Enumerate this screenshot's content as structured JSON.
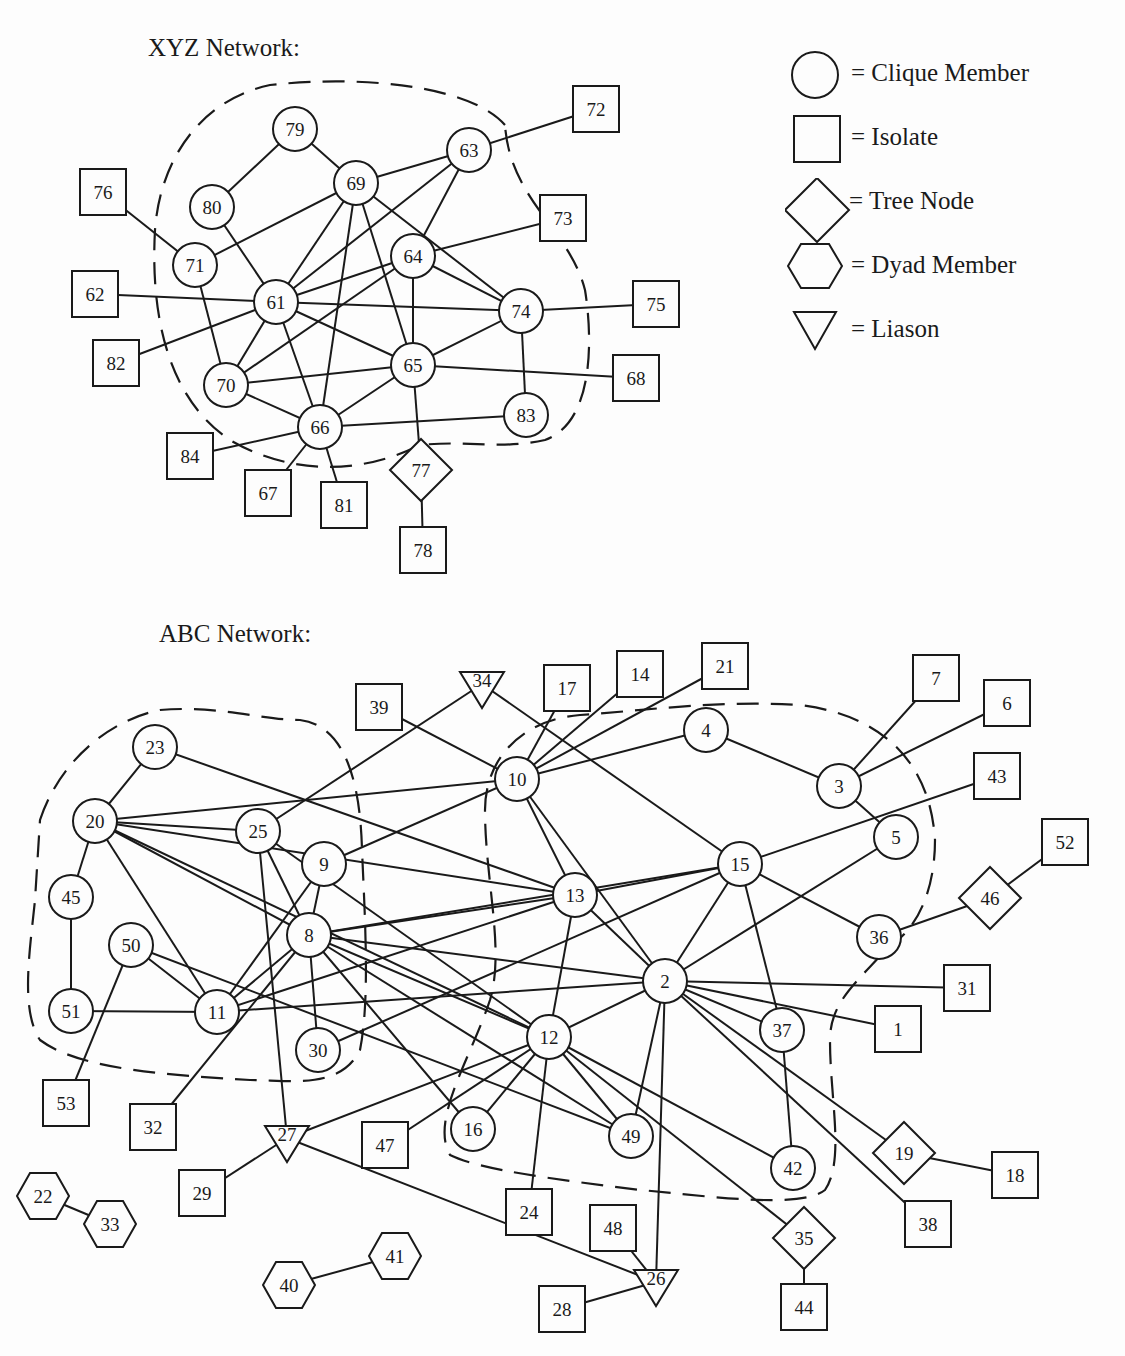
{
  "titles": {
    "xyz": "XYZ Network:",
    "abc": "ABC Network:"
  },
  "legend": [
    {
      "shape": "circle",
      "label": "= Clique Member"
    },
    {
      "shape": "square",
      "label": "= Isolate"
    },
    {
      "shape": "diamond",
      "label": "= Tree Node"
    },
    {
      "shape": "hexagon",
      "label": "= Dyad Member"
    },
    {
      "shape": "triangle",
      "label": "= Liason"
    }
  ],
  "colors": {
    "stroke": "#1a1a1a",
    "background": "#fdfdfd"
  },
  "xyz_network": {
    "nodes": [
      {
        "id": "61",
        "type": "circle",
        "x": 276,
        "y": 302
      },
      {
        "id": "62",
        "type": "square",
        "x": 95,
        "y": 294
      },
      {
        "id": "63",
        "type": "circle",
        "x": 469,
        "y": 150
      },
      {
        "id": "64",
        "type": "circle",
        "x": 413,
        "y": 256
      },
      {
        "id": "65",
        "type": "circle",
        "x": 413,
        "y": 365
      },
      {
        "id": "66",
        "type": "circle",
        "x": 320,
        "y": 427
      },
      {
        "id": "67",
        "type": "square",
        "x": 268,
        "y": 493
      },
      {
        "id": "68",
        "type": "square",
        "x": 636,
        "y": 378
      },
      {
        "id": "69",
        "type": "circle",
        "x": 356,
        "y": 183
      },
      {
        "id": "70",
        "type": "circle",
        "x": 226,
        "y": 385
      },
      {
        "id": "71",
        "type": "circle",
        "x": 195,
        "y": 265
      },
      {
        "id": "72",
        "type": "square",
        "x": 596,
        "y": 109
      },
      {
        "id": "73",
        "type": "square",
        "x": 563,
        "y": 218
      },
      {
        "id": "74",
        "type": "circle",
        "x": 521,
        "y": 311
      },
      {
        "id": "75",
        "type": "square",
        "x": 656,
        "y": 304
      },
      {
        "id": "76",
        "type": "square",
        "x": 103,
        "y": 192
      },
      {
        "id": "77",
        "type": "diamond",
        "x": 421,
        "y": 470
      },
      {
        "id": "78",
        "type": "square",
        "x": 423,
        "y": 550
      },
      {
        "id": "79",
        "type": "circle",
        "x": 295,
        "y": 129
      },
      {
        "id": "80",
        "type": "circle",
        "x": 212,
        "y": 207
      },
      {
        "id": "81",
        "type": "square",
        "x": 344,
        "y": 505
      },
      {
        "id": "82",
        "type": "square",
        "x": 116,
        "y": 363
      },
      {
        "id": "83",
        "type": "circle",
        "x": 526,
        "y": 415
      },
      {
        "id": "84",
        "type": "square",
        "x": 190,
        "y": 456
      }
    ],
    "edges": [
      [
        "79",
        "80"
      ],
      [
        "79",
        "69"
      ],
      [
        "76",
        "71"
      ],
      [
        "71",
        "69"
      ],
      [
        "71",
        "70"
      ],
      [
        "80",
        "61"
      ],
      [
        "69",
        "63"
      ],
      [
        "69",
        "61"
      ],
      [
        "69",
        "66"
      ],
      [
        "69",
        "65"
      ],
      [
        "69",
        "74"
      ],
      [
        "63",
        "72"
      ],
      [
        "63",
        "61"
      ],
      [
        "63",
        "64"
      ],
      [
        "64",
        "73"
      ],
      [
        "64",
        "61"
      ],
      [
        "64",
        "70"
      ],
      [
        "64",
        "74"
      ],
      [
        "64",
        "65"
      ],
      [
        "62",
        "61"
      ],
      [
        "82",
        "61"
      ],
      [
        "61",
        "74"
      ],
      [
        "61",
        "65"
      ],
      [
        "61",
        "70"
      ],
      [
        "61",
        "66"
      ],
      [
        "74",
        "75"
      ],
      [
        "74",
        "65"
      ],
      [
        "74",
        "83"
      ],
      [
        "65",
        "70"
      ],
      [
        "65",
        "66"
      ],
      [
        "65",
        "68"
      ],
      [
        "65",
        "77"
      ],
      [
        "70",
        "66"
      ],
      [
        "66",
        "83"
      ],
      [
        "66",
        "84"
      ],
      [
        "66",
        "67"
      ],
      [
        "66",
        "81"
      ],
      [
        "77",
        "78"
      ]
    ],
    "clique_boundary": "M505,125 C470,85 360,75 270,85 C200,100 160,160 155,230 C150,320 170,400 230,440 C290,475 360,475 420,445 C470,440 500,450 545,440 C600,420 590,320 585,290 C570,230 510,200 505,125"
  },
  "abc_network": {
    "nodes": [
      {
        "id": "1",
        "type": "square",
        "x": 898,
        "y": 1029
      },
      {
        "id": "2",
        "type": "circle",
        "x": 665,
        "y": 981
      },
      {
        "id": "3",
        "type": "circle",
        "x": 839,
        "y": 786
      },
      {
        "id": "4",
        "type": "circle",
        "x": 706,
        "y": 730
      },
      {
        "id": "5",
        "type": "circle",
        "x": 896,
        "y": 837
      },
      {
        "id": "6",
        "type": "square",
        "x": 1007,
        "y": 703
      },
      {
        "id": "7",
        "type": "square",
        "x": 936,
        "y": 678
      },
      {
        "id": "8",
        "type": "circle",
        "x": 309,
        "y": 935
      },
      {
        "id": "9",
        "type": "circle",
        "x": 324,
        "y": 864
      },
      {
        "id": "10",
        "type": "circle",
        "x": 517,
        "y": 779
      },
      {
        "id": "11",
        "type": "circle",
        "x": 217,
        "y": 1012
      },
      {
        "id": "12",
        "type": "circle",
        "x": 549,
        "y": 1037
      },
      {
        "id": "13",
        "type": "circle",
        "x": 575,
        "y": 895
      },
      {
        "id": "14",
        "type": "square",
        "x": 640,
        "y": 674
      },
      {
        "id": "15",
        "type": "circle",
        "x": 740,
        "y": 864
      },
      {
        "id": "16",
        "type": "circle",
        "x": 473,
        "y": 1129
      },
      {
        "id": "17",
        "type": "square",
        "x": 567,
        "y": 688
      },
      {
        "id": "18",
        "type": "square",
        "x": 1015,
        "y": 1175
      },
      {
        "id": "19",
        "type": "diamond",
        "x": 904,
        "y": 1153
      },
      {
        "id": "20",
        "type": "circle",
        "x": 95,
        "y": 821
      },
      {
        "id": "21",
        "type": "square",
        "x": 725,
        "y": 666
      },
      {
        "id": "22",
        "type": "hexagon",
        "x": 43,
        "y": 1196
      },
      {
        "id": "23",
        "type": "circle",
        "x": 155,
        "y": 747
      },
      {
        "id": "24",
        "type": "square",
        "x": 529,
        "y": 1212
      },
      {
        "id": "25",
        "type": "circle",
        "x": 258,
        "y": 831
      },
      {
        "id": "26",
        "type": "triangle",
        "x": 656,
        "y": 1282
      },
      {
        "id": "27",
        "type": "triangle",
        "x": 287,
        "y": 1138
      },
      {
        "id": "28",
        "type": "square",
        "x": 562,
        "y": 1309
      },
      {
        "id": "29",
        "type": "square",
        "x": 202,
        "y": 1193
      },
      {
        "id": "30",
        "type": "circle",
        "x": 318,
        "y": 1050
      },
      {
        "id": "31",
        "type": "square",
        "x": 967,
        "y": 988
      },
      {
        "id": "32",
        "type": "square",
        "x": 153,
        "y": 1127
      },
      {
        "id": "33",
        "type": "hexagon",
        "x": 110,
        "y": 1224
      },
      {
        "id": "34",
        "type": "triangle",
        "x": 482,
        "y": 684
      },
      {
        "id": "35",
        "type": "diamond",
        "x": 804,
        "y": 1238
      },
      {
        "id": "36",
        "type": "circle",
        "x": 879,
        "y": 937
      },
      {
        "id": "37",
        "type": "circle",
        "x": 782,
        "y": 1030
      },
      {
        "id": "38",
        "type": "square",
        "x": 928,
        "y": 1224
      },
      {
        "id": "39",
        "type": "square",
        "x": 379,
        "y": 707
      },
      {
        "id": "40",
        "type": "hexagon",
        "x": 289,
        "y": 1285
      },
      {
        "id": "41",
        "type": "hexagon",
        "x": 395,
        "y": 1256
      },
      {
        "id": "42",
        "type": "circle",
        "x": 793,
        "y": 1168
      },
      {
        "id": "43",
        "type": "square",
        "x": 997,
        "y": 776
      },
      {
        "id": "44",
        "type": "square",
        "x": 804,
        "y": 1307
      },
      {
        "id": "45",
        "type": "circle",
        "x": 71,
        "y": 897
      },
      {
        "id": "46",
        "type": "diamond",
        "x": 990,
        "y": 898
      },
      {
        "id": "47",
        "type": "square",
        "x": 385,
        "y": 1145
      },
      {
        "id": "48",
        "type": "square",
        "x": 613,
        "y": 1228
      },
      {
        "id": "49",
        "type": "circle",
        "x": 631,
        "y": 1136
      },
      {
        "id": "50",
        "type": "circle",
        "x": 131,
        "y": 945
      },
      {
        "id": "51",
        "type": "circle",
        "x": 71,
        "y": 1011
      },
      {
        "id": "52",
        "type": "square",
        "x": 1065,
        "y": 842
      },
      {
        "id": "53",
        "type": "square",
        "x": 66,
        "y": 1103
      }
    ],
    "edges": [
      [
        "23",
        "20"
      ],
      [
        "23",
        "13"
      ],
      [
        "20",
        "45"
      ],
      [
        "45",
        "51"
      ],
      [
        "51",
        "11"
      ],
      [
        "20",
        "11"
      ],
      [
        "20",
        "10"
      ],
      [
        "20",
        "25"
      ],
      [
        "20",
        "13"
      ],
      [
        "20",
        "12"
      ],
      [
        "20",
        "8"
      ],
      [
        "50",
        "11"
      ],
      [
        "50",
        "53"
      ],
      [
        "50",
        "49"
      ],
      [
        "25",
        "34"
      ],
      [
        "25",
        "27"
      ],
      [
        "25",
        "8"
      ],
      [
        "25",
        "12"
      ],
      [
        "9",
        "8"
      ],
      [
        "9",
        "11"
      ],
      [
        "9",
        "10"
      ],
      [
        "8",
        "11"
      ],
      [
        "8",
        "13"
      ],
      [
        "8",
        "2"
      ],
      [
        "8",
        "12"
      ],
      [
        "8",
        "16"
      ],
      [
        "8",
        "49"
      ],
      [
        "8",
        "30"
      ],
      [
        "8",
        "32"
      ],
      [
        "8",
        "15"
      ],
      [
        "11",
        "2"
      ],
      [
        "11",
        "13"
      ],
      [
        "30",
        "15"
      ],
      [
        "39",
        "10"
      ],
      [
        "34",
        "15"
      ],
      [
        "10",
        "17"
      ],
      [
        "10",
        "14"
      ],
      [
        "10",
        "21"
      ],
      [
        "10",
        "4"
      ],
      [
        "10",
        "13"
      ],
      [
        "10",
        "2"
      ],
      [
        "4",
        "3"
      ],
      [
        "3",
        "7"
      ],
      [
        "3",
        "6"
      ],
      [
        "3",
        "5"
      ],
      [
        "15",
        "43"
      ],
      [
        "15",
        "36"
      ],
      [
        "15",
        "2"
      ],
      [
        "15",
        "37"
      ],
      [
        "13",
        "15"
      ],
      [
        "5",
        "2"
      ],
      [
        "36",
        "46"
      ],
      [
        "46",
        "52"
      ],
      [
        "13",
        "12"
      ],
      [
        "13",
        "2"
      ],
      [
        "12",
        "2"
      ],
      [
        "12",
        "16"
      ],
      [
        "12",
        "47"
      ],
      [
        "12",
        "49"
      ],
      [
        "12",
        "24"
      ],
      [
        "12",
        "27"
      ],
      [
        "12",
        "42"
      ],
      [
        "12",
        "35"
      ],
      [
        "2",
        "31"
      ],
      [
        "2",
        "1"
      ],
      [
        "2",
        "37"
      ],
      [
        "2",
        "19"
      ],
      [
        "2",
        "38"
      ],
      [
        "2",
        "49"
      ],
      [
        "2",
        "26"
      ],
      [
        "37",
        "42"
      ],
      [
        "19",
        "18"
      ],
      [
        "35",
        "44"
      ],
      [
        "27",
        "29"
      ],
      [
        "27",
        "26"
      ],
      [
        "26",
        "48"
      ],
      [
        "26",
        "28"
      ],
      [
        "22",
        "33"
      ],
      [
        "40",
        "41"
      ]
    ],
    "clique_boundaries": [
      "M40,820 C60,760 110,720 160,710 C220,705 260,720 300,720 C340,725 360,770 362,850 C365,920 370,1000 360,1050 C340,1090 290,1080 250,1080 C170,1075 80,1070 40,1040 C20,1010 30,950 35,900 Z",
      "M485,810 C485,760 520,720 580,715 C650,710 720,700 800,705 C880,715 930,760 935,840 C935,900 910,935 890,945 C860,980 830,1000 830,1040 C830,1100 845,1160 825,1190 C800,1210 700,1195 640,1190 C560,1180 480,1170 450,1155 C430,1120 470,1060 490,1000 C505,950 485,880 485,810"
    ]
  }
}
